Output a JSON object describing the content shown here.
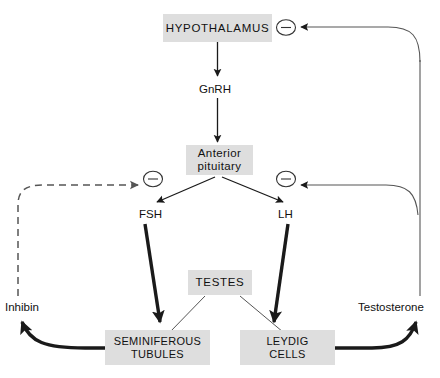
{
  "diagram": {
    "colors": {
      "box_fill": "#dedede",
      "stroke": "#1a1a1a",
      "thin_stroke": "#555555",
      "background": "#ffffff"
    },
    "nodes": {
      "hypothalamus": "HYPOTHALAMUS",
      "anterior_pituitary": "Anterior\npituitary",
      "anterior_pituitary_line1": "Anterior",
      "anterior_pituitary_line2": "pituitary",
      "testes": "TESTES",
      "seminiferous_line1": "SEMINIFEROUS",
      "seminiferous_line2": "TUBULES",
      "leydig_line1": "LEYDIG",
      "leydig_line2": "CELLS"
    },
    "hormones": {
      "gnrh": "GnRH",
      "fsh": "FSH",
      "lh": "LH",
      "inhibin": "Inhibin",
      "testosterone": "Testosterone"
    },
    "feedback": {
      "symbol": "−",
      "signs": [
        {
          "id": "minus-hypothalamus",
          "label": "−",
          "target": "HYPOTHALAMUS",
          "source": "Testosterone"
        },
        {
          "id": "minus-pituitary-left",
          "label": "−",
          "target": "Anterior pituitary",
          "source": "Inhibin"
        },
        {
          "id": "minus-pituitary-right",
          "label": "−",
          "target": "Anterior pituitary",
          "source": "Testosterone"
        }
      ]
    },
    "edges": [
      {
        "from": "HYPOTHALAMUS",
        "to": "GnRH",
        "style": "solid-thin-arrow"
      },
      {
        "from": "GnRH",
        "to": "Anterior pituitary",
        "style": "solid-thin-arrow"
      },
      {
        "from": "Anterior pituitary",
        "to": "FSH",
        "style": "solid-thin-arrow"
      },
      {
        "from": "Anterior pituitary",
        "to": "LH",
        "style": "solid-thin-arrow"
      },
      {
        "from": "FSH",
        "to": "SEMINIFEROUS TUBULES",
        "style": "solid-thick-arrow"
      },
      {
        "from": "LH",
        "to": "LEYDIG CELLS",
        "style": "solid-thick-arrow"
      },
      {
        "from": "TESTES",
        "to": "SEMINIFEROUS TUBULES",
        "style": "thin-leader"
      },
      {
        "from": "TESTES",
        "to": "LEYDIG CELLS",
        "style": "thin-leader"
      },
      {
        "from": "SEMINIFEROUS TUBULES",
        "to": "Inhibin",
        "style": "solid-thick-curve-arrow"
      },
      {
        "from": "Inhibin",
        "to": "minus-pituitary-left",
        "style": "dashed-curve-arrow"
      },
      {
        "from": "LEYDIG CELLS",
        "to": "Testosterone",
        "style": "solid-thick-curve-arrow"
      },
      {
        "from": "Testosterone",
        "to": "minus-pituitary-right",
        "style": "solid-thin-curve-arrow"
      },
      {
        "from": "Testosterone",
        "to": "minus-hypothalamus",
        "style": "solid-thin-curve-arrow"
      }
    ]
  }
}
